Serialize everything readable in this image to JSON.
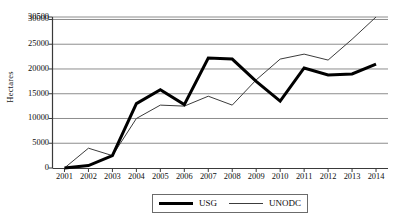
{
  "chart_data": {
    "type": "line",
    "title": "",
    "xlabel": "",
    "ylabel": "Hectares",
    "categories": [
      "2001",
      "2002",
      "2003",
      "2004",
      "2005",
      "2006",
      "2007",
      "2008",
      "2009",
      "2010",
      "2011",
      "2012",
      "2013",
      "2014"
    ],
    "x": [
      2001,
      2002,
      2003,
      2004,
      2005,
      2006,
      2007,
      2008,
      2009,
      2010,
      2011,
      2012,
      2013,
      2014
    ],
    "ylim": [
      0,
      30500
    ],
    "yticks": [
      0,
      5000,
      10000,
      15000,
      20000,
      25000,
      30000,
      30500
    ],
    "ytick_labels": [
      "0",
      "5000",
      "10000",
      "15000",
      "20000",
      "25000",
      "30000",
      "30500"
    ],
    "grid": true,
    "legend_position": "bottom-center",
    "series": [
      {
        "name": "USG",
        "style": "thick-solid-black",
        "color": "#000000",
        "width": 3,
        "values": [
          0,
          500,
          2500,
          13000,
          15800,
          12800,
          22200,
          22000,
          17500,
          13500,
          20200,
          18800,
          19000,
          21000
        ]
      },
      {
        "name": "UNODC",
        "style": "thin-solid-grey",
        "color": "#3c3c3c",
        "width": 1,
        "values": [
          0,
          4000,
          2500,
          10000,
          12700,
          12500,
          14500,
          12700,
          17800,
          22000,
          23000,
          21800,
          26000,
          30500
        ]
      }
    ]
  },
  "legend": {
    "items": [
      {
        "label": "USG",
        "swatch": "thick-line-icon"
      },
      {
        "label": "UNODC",
        "swatch": "thin-line-icon"
      }
    ]
  },
  "axes": {
    "y_title": "Hectares"
  },
  "colors": {
    "usg": "#000000",
    "unodc": "#3c3c3c",
    "grid": "#808080",
    "axis": "#3a3a3a",
    "background": "#ffffff"
  }
}
